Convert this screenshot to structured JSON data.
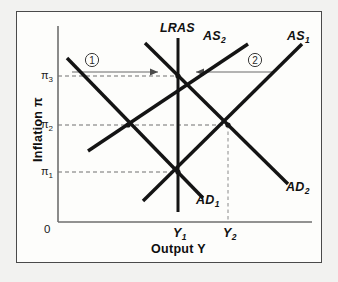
{
  "figure": {
    "name": "ad-as-inflation-output-diagram",
    "axes": {
      "x_title": "Output Y",
      "y_title": "Inflation π",
      "origin_label": "0",
      "x_ticks": [
        {
          "id": "y1",
          "label": "Y",
          "sub": "1",
          "x": 178
        },
        {
          "id": "y2",
          "label": "Y",
          "sub": "2",
          "x": 228
        }
      ],
      "y_ticks": [
        {
          "id": "pi3",
          "label": "π",
          "sub": "3",
          "y": 76
        },
        {
          "id": "pi2",
          "label": "π",
          "sub": "2",
          "y": 125
        },
        {
          "id": "pi1",
          "label": "π",
          "sub": "1",
          "y": 172
        }
      ]
    },
    "curves": [
      {
        "id": "lras",
        "label": "LRAS",
        "sub": "",
        "kind": "vertical",
        "x1": 178,
        "y1": 38,
        "x2": 178,
        "y2": 212
      },
      {
        "id": "as2",
        "label": "AS",
        "sub": "2",
        "kind": "upward",
        "x1": 88,
        "y1": 151,
        "x2": 248,
        "y2": 44
      },
      {
        "id": "as1",
        "label": "AS",
        "sub": "1",
        "kind": "upward",
        "x1": 143,
        "y1": 201,
        "x2": 302,
        "y2": 44
      },
      {
        "id": "ad1",
        "label": "AD",
        "sub": "1",
        "kind": "downward",
        "x1": 67,
        "y1": 58,
        "x2": 203,
        "y2": 198
      },
      {
        "id": "ad2",
        "label": "AD",
        "sub": "2",
        "kind": "downward",
        "x1": 145,
        "y1": 43,
        "x2": 288,
        "y2": 184
      }
    ],
    "equilibria": [
      {
        "id": "e-pi3-y1",
        "x": 178,
        "y": 76
      },
      {
        "id": "e-pi2-left",
        "x": 128,
        "y": 125
      },
      {
        "id": "e-pi2-y2",
        "x": 228,
        "y": 125
      },
      {
        "id": "e-pi1-y1",
        "x": 178,
        "y": 172
      }
    ],
    "shift_annotations": [
      {
        "id": "step-1",
        "label": "①",
        "number": "1",
        "circle_x": 92,
        "circle_y": 60,
        "arrow_x1": 72,
        "arrow_y1": 72,
        "arrow_x2": 162,
        "arrow_y2": 72,
        "direction": "right"
      },
      {
        "id": "step-2",
        "label": "②",
        "number": "2",
        "circle_x": 255,
        "circle_y": 60,
        "arrow_x1": 272,
        "arrow_y1": 72,
        "arrow_x2": 192,
        "arrow_y2": 72,
        "direction": "left"
      }
    ],
    "colors": {
      "background": "#f2f2f0",
      "panel": "#fdfdfb",
      "frame_border": "#4a4a4a",
      "axis": "#6e6e6e",
      "curve": "#141414",
      "dashed_guide": "#707070",
      "arrow": "#6a6a6a",
      "text": "#111111"
    }
  }
}
